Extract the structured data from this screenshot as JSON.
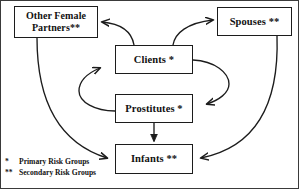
{
  "diagram": {
    "stroke_color": "#1c1c1c",
    "background_color": "#ffffff",
    "nodes": [
      {
        "id": "other_female_partners",
        "label": "Other Female\nPartners**"
      },
      {
        "id": "spouses",
        "label": "Spouses **"
      },
      {
        "id": "clients",
        "label": "Clients *"
      },
      {
        "id": "prostitutes",
        "label": "Prostitutes *"
      },
      {
        "id": "infants",
        "label": "Infants **"
      }
    ],
    "edges": [
      {
        "from": "clients",
        "to": "other_female_partners",
        "style": "curved-arrow"
      },
      {
        "from": "clients",
        "to": "spouses",
        "style": "curved-arrow"
      },
      {
        "from": "clients",
        "to": "prostitutes",
        "style": "curved-arrow-right-loop"
      },
      {
        "from": "prostitutes",
        "to": "clients",
        "style": "curved-arrow-left-loop"
      },
      {
        "from": "prostitutes",
        "to": "infants",
        "style": "straight-arrow"
      },
      {
        "from": "other_female_partners",
        "to": "infants",
        "style": "long-curve-arrow"
      },
      {
        "from": "spouses",
        "to": "infants",
        "style": "long-curve-arrow"
      }
    ],
    "legend": [
      {
        "mark": "*",
        "text": "Primary Risk Groups"
      },
      {
        "mark": "**",
        "text": "Secondary Risk Groups"
      }
    ]
  }
}
